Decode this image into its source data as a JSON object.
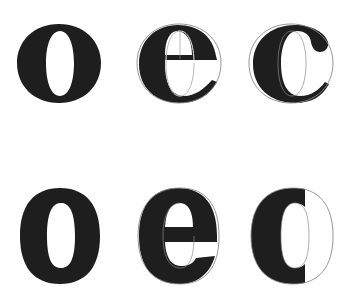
{
  "figure": {
    "description": "Construction of letters e and c from letter o, serif (top row) and sans-serif (bottom row)",
    "ink_color": "#1e1e1e",
    "guide_color": "#8a8a8a",
    "background": "#ffffff",
    "rows": [
      {
        "style": "serif",
        "glyphs": [
          {
            "letter": "o",
            "has_guide_outline": false
          },
          {
            "letter": "e",
            "has_guide_outline": true,
            "guide": "o outline"
          },
          {
            "letter": "c",
            "has_guide_outline": true,
            "guide": "o outline"
          }
        ]
      },
      {
        "style": "sans-serif",
        "glyphs": [
          {
            "letter": "o",
            "has_guide_outline": false
          },
          {
            "letter": "e",
            "has_guide_outline": true,
            "guide": "o outline"
          },
          {
            "letter": "c",
            "has_guide_outline": true,
            "guide": "o outline"
          }
        ]
      }
    ]
  }
}
